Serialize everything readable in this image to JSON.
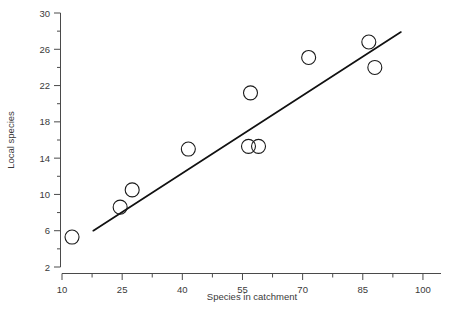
{
  "chart_data": {
    "type": "scatter",
    "title": "",
    "xlabel": "Species in catchment",
    "ylabel": "Local species",
    "xlim": [
      10,
      104.5
    ],
    "ylim": [
      2,
      30
    ],
    "grid": false,
    "legend": null,
    "x_major_ticks": [
      10,
      25,
      40,
      55,
      70,
      85,
      100
    ],
    "x_major_tick_labels": [
      "10",
      "25",
      "40",
      "55",
      "70",
      "85",
      "100"
    ],
    "x_minor_ticks": [
      17.5,
      32.5,
      47.5,
      62.5,
      77.5,
      92.5
    ],
    "y_major_ticks": [
      2,
      6,
      10,
      14,
      18,
      22,
      26,
      30
    ],
    "y_major_tick_labels": [
      "2",
      "6",
      "10",
      "14",
      "18",
      "22",
      "26",
      "30"
    ],
    "y_minor_ticks": [
      4,
      8,
      12,
      16,
      20,
      24,
      28
    ],
    "marker_style": "open-circle",
    "marker_radius_px": 7,
    "points": [
      {
        "x": 12.5,
        "y": 5.3
      },
      {
        "x": 24.5,
        "y": 8.6
      },
      {
        "x": 27.5,
        "y": 10.5
      },
      {
        "x": 41.5,
        "y": 15.0
      },
      {
        "x": 56.5,
        "y": 15.3
      },
      {
        "x": 59.0,
        "y": 15.3
      },
      {
        "x": 57.0,
        "y": 21.2
      },
      {
        "x": 71.5,
        "y": 25.1
      },
      {
        "x": 86.5,
        "y": 26.8
      },
      {
        "x": 88.0,
        "y": 24.0
      }
    ],
    "fit_line": {
      "type": "linear-regression",
      "x_start": 17.8,
      "y_start": 6.0,
      "x_end": 94.5,
      "y_end": 27.9
    },
    "colors": {
      "marker_stroke": "#1a1a1a",
      "fit_line": "#111111",
      "axis": "#4a4a4a",
      "text": "#3a3a3a",
      "background": "#ffffff"
    }
  }
}
